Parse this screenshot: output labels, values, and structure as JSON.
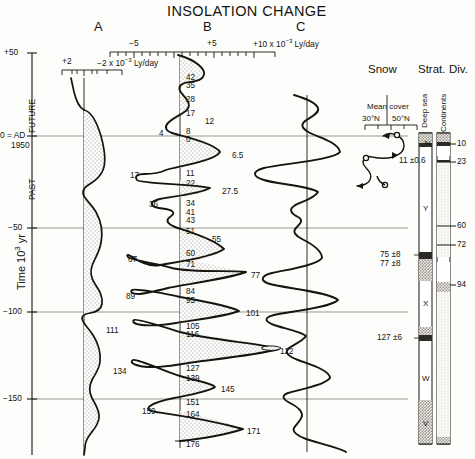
{
  "title": "INSOLATION CHANGE",
  "panels": [
    {
      "letter": "A",
      "x": 97
    },
    {
      "letter": "B",
      "x": 206
    },
    {
      "letter": "C",
      "x": 299
    }
  ],
  "axes": {
    "time_axis_label": "Time 10",
    "time_axis_exp": "3",
    "time_axis_unit": " yr",
    "time_ticks": [
      {
        "label": "+50",
        "value": 50
      },
      {
        "label": "0 = AD",
        "sub": "1950",
        "value": 0
      },
      {
        "label": "−50",
        "value": -50
      },
      {
        "label": "−100",
        "value": -100
      },
      {
        "label": "−150",
        "value": -150
      }
    ],
    "era_future": "FUTURE",
    "era_past": "PAST",
    "scale_a": {
      "left_label": "+2",
      "right_label": "−2 x 10",
      "exp": "−3",
      "unit": " Ly/day"
    },
    "scale_b": {
      "tick_minus5": "−5",
      "tick_plus5": "+5",
      "tick_plus10": "+10 x 10",
      "exp": "−3",
      "unit": " Ly/day"
    }
  },
  "right_headers": {
    "snow": "Snow",
    "strat": "Strat.",
    "div": "Div."
  },
  "snow_panel": {
    "mean_cover": "Mean cover",
    "lat_30": "30°N",
    "lat_50": "50°N",
    "date_label": "11 ±0.6"
  },
  "columns": {
    "deep_sea_label": "Deep sea",
    "continents_label": "Continents",
    "deep_sea_stages": [
      "Z",
      "Y",
      "X",
      "W",
      "V"
    ],
    "deep_sea_dates": [
      "75 ±8",
      "77 ±8",
      "127 ±6"
    ],
    "continent_dates": [
      "10",
      "23",
      "60",
      "72",
      "94"
    ]
  },
  "chart_data": {
    "type": "line",
    "title": "INSOLATION CHANGE",
    "ylabel": "Time 10^3 yr",
    "ylim": [
      -180,
      55
    ],
    "grid": true,
    "series": [
      {
        "name": "A",
        "xlabel": "+2 to -2 x 10^-3 Ly/day",
        "note": "reversed axis, stippled fill on negative side"
      },
      {
        "name": "B",
        "xlabel": "-5 to +10 x 10^-3 Ly/day",
        "peak_ages_ky": [
          42,
          35,
          28,
          17,
          12,
          8,
          0,
          6.5,
          11,
          22,
          27.5,
          34,
          41,
          43,
          51,
          55,
          60,
          71,
          77,
          84,
          95,
          101,
          105,
          116,
          122,
          127,
          139,
          145,
          151,
          164,
          171,
          176
        ],
        "left_side_ages_ky": [
          4,
          17,
          36,
          67,
          89,
          111,
          134,
          159
        ]
      },
      {
        "name": "C",
        "xlabel": "-5 to +10 x 10^-3 Ly/day"
      }
    ],
    "annotations": [
      {
        "text": "11 ±0.6",
        "panel": "snow"
      },
      {
        "text": "75 ±8",
        "panel": "deep-sea"
      },
      {
        "text": "77 ±8",
        "panel": "deep-sea"
      },
      {
        "text": "127 ±6",
        "panel": "deep-sea"
      }
    ]
  },
  "b_labels_right": [
    {
      "v": "42",
      "y": 74,
      "x": 186
    },
    {
      "v": "35",
      "y": 82,
      "x": 186
    },
    {
      "v": "28",
      "y": 96,
      "x": 186
    },
    {
      "v": "17",
      "y": 110,
      "x": 186
    },
    {
      "v": "12",
      "y": 118,
      "x": 205
    },
    {
      "v": "8",
      "y": 128,
      "x": 186
    },
    {
      "v": "0",
      "y": 136,
      "x": 186
    },
    {
      "v": "6.5",
      "y": 152,
      "x": 232
    },
    {
      "v": "11",
      "y": 170,
      "x": 186
    },
    {
      "v": "22",
      "y": 180,
      "x": 186
    },
    {
      "v": "27.5",
      "y": 188,
      "x": 222
    },
    {
      "v": "34",
      "y": 200,
      "x": 186
    },
    {
      "v": "41",
      "y": 209,
      "x": 186
    },
    {
      "v": "43",
      "y": 217,
      "x": 186
    },
    {
      "v": "51",
      "y": 228,
      "x": 186
    },
    {
      "v": "55",
      "y": 236,
      "x": 212
    },
    {
      "v": "60",
      "y": 250,
      "x": 186
    },
    {
      "v": "71",
      "y": 261,
      "x": 186
    },
    {
      "v": "77",
      "y": 272,
      "x": 251
    },
    {
      "v": "84",
      "y": 288,
      "x": 186
    },
    {
      "v": "95",
      "y": 297,
      "x": 186
    },
    {
      "v": "101",
      "y": 310,
      "x": 246
    },
    {
      "v": "105",
      "y": 323,
      "x": 186
    },
    {
      "v": "116",
      "y": 331,
      "x": 186
    },
    {
      "v": "122",
      "y": 348,
      "x": 280
    },
    {
      "v": "127",
      "y": 365,
      "x": 186
    },
    {
      "v": "139",
      "y": 375,
      "x": 186
    },
    {
      "v": "145",
      "y": 386,
      "x": 221
    },
    {
      "v": "151",
      "y": 399,
      "x": 186
    },
    {
      "v": "164",
      "y": 411,
      "x": 186
    },
    {
      "v": "171",
      "y": 428,
      "x": 247
    },
    {
      "v": "176",
      "y": 441,
      "x": 186
    }
  ],
  "b_labels_left": [
    {
      "v": "4",
      "y": 130,
      "x": 159
    },
    {
      "v": "17",
      "y": 172,
      "x": 130
    },
    {
      "v": "36",
      "y": 201,
      "x": 149
    },
    {
      "v": "67",
      "y": 256,
      "x": 128
    },
    {
      "v": "89",
      "y": 293,
      "x": 126
    },
    {
      "v": "111",
      "y": 327,
      "x": 106
    },
    {
      "v": "134",
      "y": 368,
      "x": 113
    },
    {
      "v": "159",
      "y": 408,
      "x": 142
    }
  ]
}
